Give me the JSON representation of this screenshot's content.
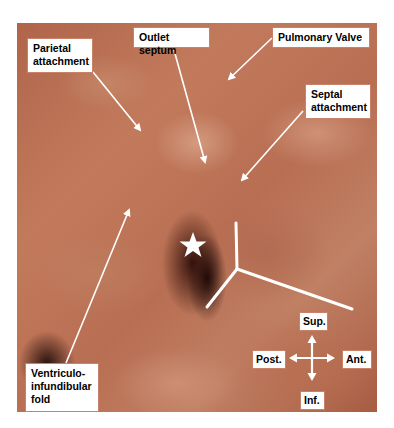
{
  "figure": {
    "labels": {
      "parietal_attachment": "Parietal attachment",
      "outlet_septum": "Outlet septum",
      "pulmonary_valve": "Pulmonary Valve",
      "septal_attachment": "Septal attachment",
      "ventriculo_infundibular_fold": "Ventriculo-infundibular fold"
    },
    "label_lines": {
      "parietal_attachment": [
        "Parietal",
        "attachment"
      ],
      "septal_attachment": [
        "Septal",
        "attachment"
      ],
      "ventriculo_infundibular_fold": [
        "Ventriculo-",
        "infundibular",
        "fold"
      ]
    },
    "markers": {
      "star": "star-marker",
      "y_shape": "septomarginal-trabeculation-marker"
    },
    "orientation": {
      "sup": "Sup.",
      "inf": "Inf.",
      "post": "Post.",
      "ant": "Ant."
    },
    "colors": {
      "tissue": "#b8704f",
      "label_bg": "#ffffff",
      "label_text": "#000000",
      "annotation": "#ffffff"
    }
  }
}
